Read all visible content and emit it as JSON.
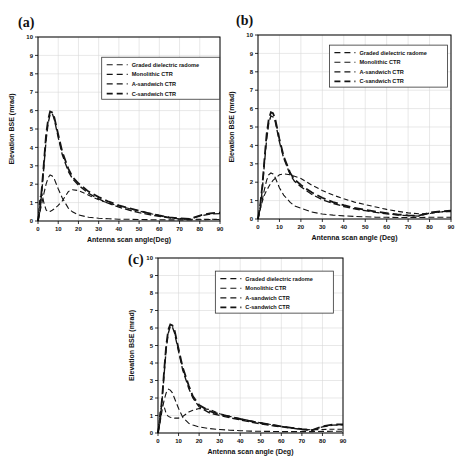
{
  "figure": {
    "background": "#ffffff",
    "curve_color": "#141414",
    "grid_color": "#d9d9d9",
    "panel_labels": [
      "(a)",
      "(b)",
      "(c)"
    ]
  },
  "chart_data": [
    {
      "type": "line",
      "panel_label": "(a)",
      "xlabel": "Antenna scan angle(Deg)",
      "ylabel": "Elevation BSE (mrad)",
      "xlim": [
        0,
        90
      ],
      "ylim": [
        0,
        10
      ],
      "xticks": [
        0,
        10,
        20,
        30,
        40,
        50,
        60,
        70,
        80,
        90
      ],
      "yticks": [
        0,
        1,
        2,
        3,
        4,
        5,
        6,
        7,
        8,
        9,
        10
      ],
      "grid": true,
      "legend_position": "upper-right-inside",
      "x": [
        0,
        1,
        2,
        3,
        4,
        5,
        6,
        7,
        8,
        10,
        12,
        15,
        17,
        20,
        25,
        30,
        35,
        40,
        45,
        50,
        55,
        60,
        65,
        70,
        75,
        80,
        85,
        90
      ],
      "series": [
        {
          "name": "graded-dielectric-radome",
          "label": "Graded dielectric radome",
          "values": [
            0,
            1.3,
            1.45,
            0.95,
            0.6,
            0.5,
            0.52,
            0.58,
            0.65,
            0.85,
            1.1,
            1.6,
            1.7,
            1.65,
            1.4,
            1.15,
            0.97,
            0.82,
            0.68,
            0.55,
            0.42,
            0.3,
            0.2,
            0.13,
            0.1,
            0.1,
            0.1,
            0.1
          ]
        },
        {
          "name": "monolithic-ctr",
          "label": "Monolithic CTR",
          "values": [
            0,
            0.5,
            1.0,
            1.55,
            2.0,
            2.35,
            2.5,
            2.45,
            2.3,
            1.75,
            1.25,
            0.7,
            0.5,
            0.33,
            0.2,
            0.15,
            0.12,
            0.1,
            0.09,
            0.08,
            0.07,
            0.07,
            0.06,
            0.06,
            0.06,
            0.07,
            0.08,
            0.08
          ]
        },
        {
          "name": "a-sandwich-ctr",
          "label": "A-sandwich CTR",
          "values": [
            0,
            0.6,
            1.7,
            3.1,
            4.4,
            5.3,
            5.8,
            5.85,
            5.55,
            4.55,
            3.6,
            2.7,
            2.3,
            1.95,
            1.5,
            1.2,
            0.95,
            0.75,
            0.6,
            0.45,
            0.35,
            0.25,
            0.17,
            0.12,
            0.1,
            0.27,
            0.38,
            0.4
          ]
        },
        {
          "name": "c-sandwich-ctr",
          "label": "C-sandwich CTR",
          "values": [
            0,
            0.7,
            1.9,
            3.3,
            4.7,
            5.5,
            5.95,
            5.9,
            5.65,
            4.7,
            3.75,
            2.85,
            2.4,
            2.05,
            1.6,
            1.3,
            1.05,
            0.85,
            0.7,
            0.55,
            0.42,
            0.3,
            0.2,
            0.14,
            0.12,
            0.3,
            0.42,
            0.45
          ]
        }
      ]
    },
    {
      "type": "line",
      "panel_label": "(b)",
      "xlabel": "Antenna scan angle (Deg)",
      "ylabel": "Elevation BSE (mrad)",
      "xlim": [
        0,
        90
      ],
      "ylim": [
        0,
        10
      ],
      "xticks": [
        0,
        10,
        20,
        30,
        40,
        50,
        60,
        70,
        80,
        90
      ],
      "yticks": [
        0,
        1,
        2,
        3,
        4,
        5,
        6,
        7,
        8,
        9,
        10
      ],
      "grid": true,
      "legend_position": "upper-right-inside",
      "x": [
        0,
        1,
        2,
        3,
        4,
        5,
        6,
        7,
        8,
        10,
        12,
        15,
        17,
        20,
        25,
        30,
        35,
        40,
        45,
        50,
        55,
        60,
        65,
        70,
        75,
        80,
        85,
        90
      ],
      "series": [
        {
          "name": "graded-dielectric-radome",
          "label": "Graded dielectric radome",
          "values": [
            0,
            0.5,
            0.95,
            1.3,
            1.55,
            1.75,
            1.95,
            2.1,
            2.2,
            2.4,
            2.45,
            2.4,
            2.32,
            2.2,
            1.85,
            1.55,
            1.3,
            1.1,
            0.92,
            0.78,
            0.65,
            0.52,
            0.42,
            0.33,
            0.28,
            0.3,
            0.38,
            0.4
          ]
        },
        {
          "name": "monolithic-ctr",
          "label": "Monolithic CTR",
          "values": [
            0,
            0.5,
            1.05,
            1.6,
            2.1,
            2.4,
            2.5,
            2.45,
            2.25,
            1.7,
            1.3,
            0.9,
            0.72,
            0.58,
            0.38,
            0.27,
            0.21,
            0.17,
            0.14,
            0.12,
            0.1,
            0.09,
            0.08,
            0.08,
            0.08,
            0.09,
            0.1,
            0.1
          ]
        },
        {
          "name": "a-sandwich-ctr",
          "label": "A-sandwich CTR",
          "values": [
            0,
            0.6,
            1.6,
            3.0,
            4.3,
            5.2,
            5.6,
            5.55,
            5.3,
            4.2,
            3.3,
            2.4,
            2.05,
            1.75,
            1.35,
            1.05,
            0.85,
            0.68,
            0.55,
            0.45,
            0.36,
            0.28,
            0.22,
            0.18,
            0.16,
            0.32,
            0.4,
            0.42
          ]
        },
        {
          "name": "c-sandwich-ctr",
          "label": "C-sandwich CTR",
          "values": [
            0,
            0.7,
            1.8,
            3.2,
            4.6,
            5.4,
            5.8,
            5.75,
            5.45,
            4.35,
            3.4,
            2.5,
            2.15,
            1.85,
            1.45,
            1.15,
            0.92,
            0.75,
            0.6,
            0.5,
            0.4,
            0.32,
            0.25,
            0.2,
            0.18,
            0.35,
            0.42,
            0.45
          ]
        }
      ]
    },
    {
      "type": "line",
      "panel_label": "(c)",
      "xlabel": "Antenna scan angle (Deg)",
      "ylabel": "Elevation BSE (mrad)",
      "xlim": [
        0,
        90
      ],
      "ylim": [
        0,
        10
      ],
      "xticks": [
        0,
        10,
        20,
        30,
        40,
        50,
        60,
        70,
        80,
        90
      ],
      "yticks": [
        0,
        1,
        2,
        3,
        4,
        5,
        6,
        7,
        8,
        9,
        10
      ],
      "grid": true,
      "legend_position": "upper-right-inside",
      "x": [
        0,
        1,
        2,
        3,
        4,
        5,
        6,
        7,
        8,
        10,
        12,
        15,
        17,
        20,
        25,
        30,
        35,
        40,
        45,
        50,
        55,
        60,
        65,
        70,
        75,
        80,
        85,
        90
      ],
      "series": [
        {
          "name": "graded-dielectric-radome",
          "label": "Graded dielectric radome",
          "values": [
            0,
            1.2,
            1.6,
            1.5,
            1.1,
            0.95,
            0.9,
            0.88,
            0.85,
            0.85,
            0.95,
            1.2,
            1.3,
            1.4,
            1.35,
            1.1,
            0.95,
            0.82,
            0.7,
            0.58,
            0.48,
            0.38,
            0.3,
            0.22,
            0.18,
            0.2,
            0.22,
            0.22
          ]
        },
        {
          "name": "monolithic-ctr",
          "label": "Monolithic CTR",
          "values": [
            0,
            0.6,
            1.3,
            1.9,
            2.3,
            2.5,
            2.45,
            2.3,
            2.0,
            1.4,
            0.9,
            0.55,
            0.45,
            0.35,
            0.25,
            0.2,
            0.16,
            0.13,
            0.11,
            0.1,
            0.09,
            0.08,
            0.08,
            0.08,
            0.08,
            0.09,
            0.1,
            0.1
          ]
        },
        {
          "name": "a-sandwich-ctr",
          "label": "A-sandwich CTR",
          "values": [
            0,
            0.7,
            1.9,
            3.4,
            4.8,
            5.7,
            6.1,
            6.05,
            5.75,
            4.65,
            3.6,
            2.55,
            2.0,
            1.5,
            1.15,
            1.0,
            0.87,
            0.75,
            0.63,
            0.52,
            0.43,
            0.35,
            0.28,
            0.2,
            0.15,
            0.35,
            0.45,
            0.47
          ]
        },
        {
          "name": "c-sandwich-ctr",
          "label": "C-sandwich CTR",
          "values": [
            0,
            0.8,
            2.0,
            3.6,
            5.0,
            5.9,
            6.2,
            6.15,
            5.9,
            4.8,
            3.75,
            2.7,
            2.1,
            1.6,
            1.25,
            1.08,
            0.93,
            0.8,
            0.68,
            0.57,
            0.47,
            0.38,
            0.3,
            0.22,
            0.17,
            0.38,
            0.48,
            0.5
          ]
        }
      ]
    }
  ]
}
